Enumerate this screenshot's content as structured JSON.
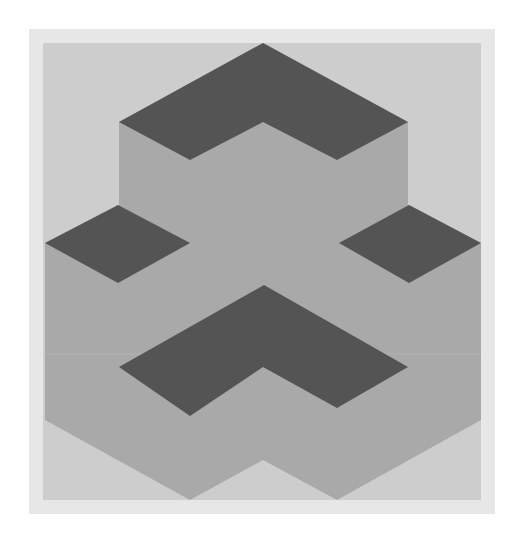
{
  "artwork": {
    "title": "Isometric stacked-cube illusion",
    "colors": {
      "page": "#ffffff",
      "frame": "#e7e7e7",
      "background": "#cdcdcd",
      "side_face": "#a9a9a9",
      "top_face": "#545454",
      "seam": "#b6b6b6"
    },
    "shapes": [
      {
        "id": "upper-block-sides",
        "role": "side_face"
      },
      {
        "id": "lower-block-sides",
        "role": "side_face"
      },
      {
        "id": "upper-chevron-top",
        "role": "top_face"
      },
      {
        "id": "left-diamond-top",
        "role": "top_face"
      },
      {
        "id": "right-diamond-top",
        "role": "top_face"
      },
      {
        "id": "lower-chevron-top",
        "role": "top_face"
      }
    ]
  }
}
